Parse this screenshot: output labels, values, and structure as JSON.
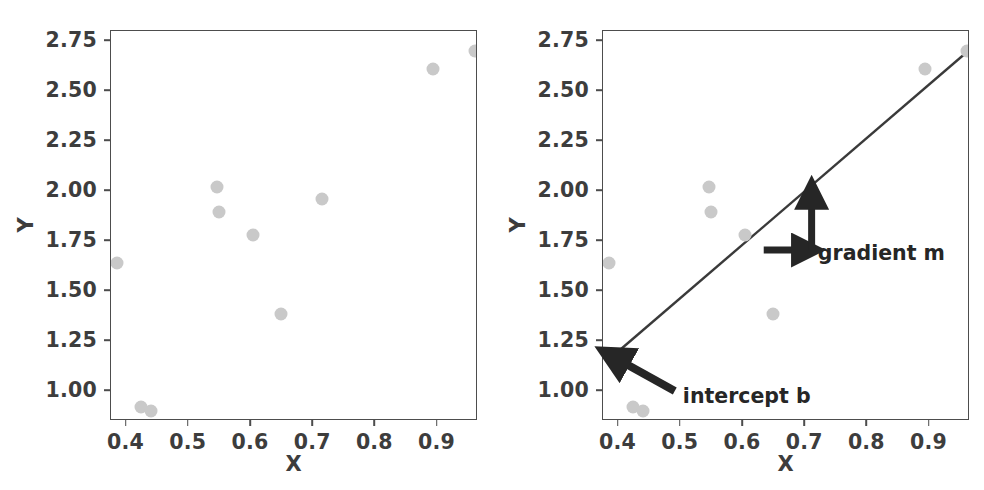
{
  "figure": {
    "width": 984,
    "height": 490,
    "background": "#ffffff",
    "point_color": "#c9c9c9",
    "line_color": "#3a3a3a",
    "annotation_color": "#262626",
    "axis_color": "#4d4d4d"
  },
  "axis": {
    "xlabel": "X",
    "ylabel": "Y",
    "xticks": [
      "0.4",
      "0.5",
      "0.6",
      "0.7",
      "0.8",
      "0.9"
    ],
    "yticks": [
      "1.00",
      "1.25",
      "1.50",
      "1.75",
      "2.00",
      "2.25",
      "2.50",
      "2.75"
    ],
    "xlim": [
      0.375,
      0.965
    ],
    "ylim": [
      0.85,
      2.8
    ]
  },
  "annotations": {
    "gradient_label": "gradient m",
    "intercept_label": "intercept b"
  },
  "chart_data": [
    {
      "type": "scatter",
      "title": "",
      "panel": "left",
      "xlabel": "X",
      "ylabel": "Y",
      "xlim": [
        0.375,
        0.965
      ],
      "ylim": [
        0.85,
        2.8
      ],
      "xticks": [
        0.4,
        0.5,
        0.6,
        0.7,
        0.8,
        0.9
      ],
      "yticks": [
        1.0,
        1.25,
        1.5,
        1.75,
        2.0,
        2.25,
        2.5,
        2.75
      ],
      "grid": false,
      "legend": null,
      "marker_color": "#c9c9c9",
      "x": [
        0.385,
        0.423,
        0.44,
        0.546,
        0.549,
        0.603,
        0.648,
        0.714,
        0.892,
        0.96
      ],
      "y": [
        1.64,
        0.921,
        0.901,
        2.018,
        1.893,
        1.782,
        1.384,
        1.962,
        2.612,
        2.7
      ]
    },
    {
      "type": "scatter",
      "title": "",
      "panel": "right",
      "xlabel": "X",
      "ylabel": "Y",
      "xlim": [
        0.375,
        0.965
      ],
      "ylim": [
        0.85,
        2.8
      ],
      "xticks": [
        0.4,
        0.5,
        0.6,
        0.7,
        0.8,
        0.9
      ],
      "yticks": [
        1.0,
        1.25,
        1.5,
        1.75,
        2.0,
        2.25,
        2.5,
        2.75
      ],
      "grid": false,
      "legend": null,
      "marker_color": "#c9c9c9",
      "x": [
        0.385,
        0.423,
        0.44,
        0.546,
        0.549,
        0.603,
        0.648,
        0.714,
        0.892,
        0.96
      ],
      "y": [
        1.64,
        0.921,
        0.901,
        2.018,
        1.893,
        1.782,
        1.384,
        1.962,
        2.612,
        2.7
      ],
      "fit_line": {
        "type": "line",
        "x": [
          0.389,
          0.962
        ],
        "y": [
          1.17,
          2.7
        ],
        "slope": 2.67,
        "intercept": 0.131,
        "color": "#3a3a3a"
      },
      "annotations": [
        {
          "label": "gradient m",
          "arrows": [
            {
              "name": "run-arrow",
              "from_x": 0.635,
              "from_y": 1.7,
              "to_x": 0.706,
              "to_y": 1.7
            },
            {
              "name": "rise-arrow",
              "from_x": 0.712,
              "from_y": 1.7,
              "to_x": 0.712,
              "to_y": 1.985
            }
          ],
          "text_x": 0.722,
          "text_y": 1.69
        },
        {
          "label": "intercept b",
          "arrows": [
            {
              "name": "intercept-arrow",
              "from_x": 0.492,
              "from_y": 0.995,
              "to_x": 0.392,
              "to_y": 1.168
            }
          ],
          "text_x": 0.505,
          "text_y": 0.975
        }
      ]
    }
  ]
}
